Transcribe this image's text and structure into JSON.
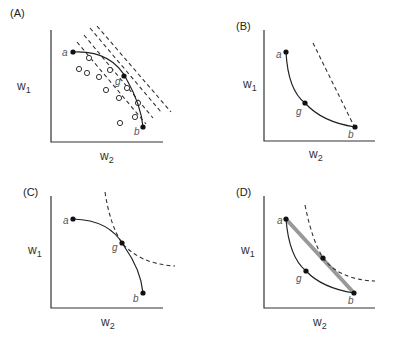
{
  "figure": {
    "panels": [
      {
        "id": "A",
        "label": "(A)",
        "y_axis": "w",
        "y_sub": "1",
        "x_axis": "w",
        "x_sub": "2",
        "points": {
          "a": "a",
          "g": "g",
          "b": "b"
        },
        "description": "concave frontier with open-circle feasible points and four parallel dashed iso-lines"
      },
      {
        "id": "B",
        "label": "(B)",
        "y_axis": "w",
        "y_sub": "1",
        "x_axis": "w",
        "x_sub": "2",
        "points": {
          "a": "a",
          "g": "g",
          "b": "b"
        },
        "description": "convex frontier with steep dashed line through b"
      },
      {
        "id": "C",
        "label": "(C)",
        "y_axis": "w",
        "y_sub": "1",
        "x_axis": "w",
        "x_sub": "2",
        "points": {
          "a": "a",
          "g": "g",
          "b": "b"
        },
        "description": "concave frontier tangent to dashed indifference curve at g"
      },
      {
        "id": "D",
        "label": "(D)",
        "y_axis": "w",
        "y_sub": "1",
        "x_axis": "w",
        "x_sub": "2",
        "points": {
          "a": "a",
          "g": "g",
          "b": "b"
        },
        "description": "convex frontier with thick grey chord a-b tangent to dashed indifference curve"
      }
    ]
  }
}
